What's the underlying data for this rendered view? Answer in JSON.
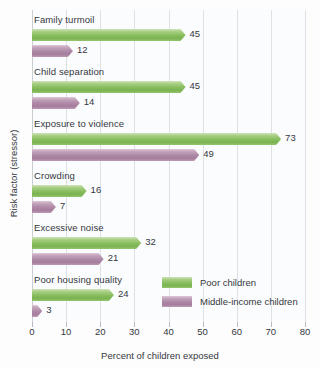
{
  "chart_data": {
    "type": "bar",
    "orientation": "horizontal",
    "title": "",
    "xlabel": "Percent of children exposed",
    "ylabel": "Risk factor (stressor)",
    "xlim": [
      0,
      80
    ],
    "xticks": [
      0,
      10,
      20,
      30,
      40,
      50,
      60,
      70,
      80
    ],
    "grid": true,
    "legend_position": "inside-lower-right",
    "categories": [
      "Family turmoil",
      "Child separation",
      "Exposure to violence",
      "Crowding",
      "Excessive noise",
      "Poor housing quality"
    ],
    "series": [
      {
        "name": "Poor children",
        "color": "#86bd5c",
        "values": [
          45,
          45,
          73,
          16,
          32,
          24
        ]
      },
      {
        "name": "Middle-income children",
        "color": "#ad87a5",
        "values": [
          12,
          14,
          49,
          7,
          21,
          3
        ]
      }
    ]
  },
  "colors": {
    "poor": "#86bd5c",
    "middle_income": "#ad87a5",
    "gridline": "#dde1e6",
    "text": "#35383d",
    "background": "#fdfdfd"
  }
}
